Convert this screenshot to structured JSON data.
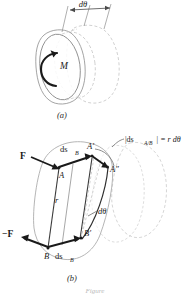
{
  "figure": {
    "type": "engineering-mechanics-diagram",
    "topic": "Virtual work of a couple",
    "background_color": "#ffffff",
    "ink_color": "#1a1a1a",
    "ghost_outline_color": "#c9c9c9",
    "bottom_cut_caption": "Figure"
  },
  "panel_a": {
    "caption": "(a)",
    "labels": {
      "moment": "M",
      "rotation": "dθ"
    },
    "description": "Rigid body rotated through angle d-theta by couple moment M; original position solid, displaced position shown dashed."
  },
  "panel_b": {
    "caption": "(b)",
    "labels": {
      "force_positive": "F",
      "force_negative": "−F",
      "point_a": "A",
      "point_a_prime": "A′",
      "point_a_double_prime": "A″",
      "point_b": "B",
      "point_b_prime": "B′",
      "ds_b_upper": "ds",
      "ds_b_upper_sub": "B",
      "ds_b_lower": "ds",
      "ds_b_lower_sub": "B",
      "radius": "r",
      "rotation": "dθ",
      "relative_displacement": "|ds",
      "relative_displacement_sub": "A/B",
      "relative_displacement_tail": "| = r dθ"
    },
    "description": "Couple F and -F acting at A and B. Translation ds_B carries A to A'; rotation d-theta carries A' to A''. Relative displacement magnitude equals r d-theta."
  }
}
